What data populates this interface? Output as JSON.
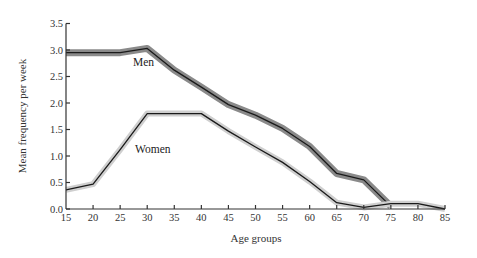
{
  "chart_data": {
    "type": "line",
    "title": "",
    "xlabel": "Age groups",
    "ylabel": "Mean frequency per week",
    "xlim": [
      15,
      85
    ],
    "ylim": [
      0,
      3.5
    ],
    "xticks": [
      15,
      20,
      25,
      30,
      35,
      40,
      45,
      50,
      55,
      60,
      65,
      70,
      75,
      80,
      85
    ],
    "yticks": [
      "0.0",
      "0.5",
      "1.0",
      "1.5",
      "2.0",
      "2.5",
      "3.0",
      "3.5"
    ],
    "grid": false,
    "legend": "inline labels",
    "series": [
      {
        "name": "Men",
        "label_text": "Men",
        "core_color": "#1a1a1a",
        "halo_color": "#8a8a8a",
        "x": [
          15,
          20,
          25,
          30,
          35,
          40,
          45,
          50,
          55,
          60,
          65,
          70,
          75
        ],
        "values": [
          2.95,
          2.95,
          2.95,
          3.03,
          2.62,
          2.3,
          1.97,
          1.77,
          1.52,
          1.18,
          0.67,
          0.55,
          0.05
        ]
      },
      {
        "name": "Women",
        "label_text": "Women",
        "core_color": "#1a1a1a",
        "halo_color": "#cfcfcf",
        "x": [
          15,
          20,
          25,
          30,
          35,
          40,
          45,
          50,
          55,
          60,
          65,
          70,
          75,
          80,
          85
        ],
        "values": [
          0.36,
          0.47,
          1.12,
          1.8,
          1.8,
          1.8,
          1.47,
          1.17,
          0.88,
          0.52,
          0.12,
          0.03,
          0.1,
          0.1,
          0.0
        ]
      }
    ]
  }
}
